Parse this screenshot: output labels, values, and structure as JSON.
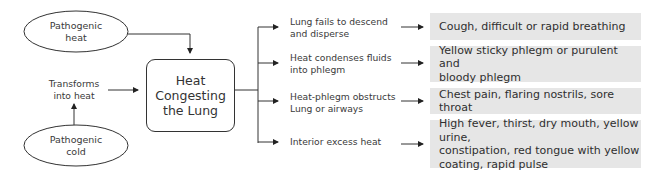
{
  "causes": {
    "heat": "Pathogenic heat",
    "heat_lines": [
      "Pathogenic",
      "heat"
    ],
    "cold_lines": [
      "Pathogenic",
      "cold"
    ],
    "transform_lines": [
      "Transforms",
      "into heat"
    ]
  },
  "center": {
    "lines": [
      "Heat",
      "Congesting",
      "the Lung"
    ]
  },
  "mechanisms": [
    {
      "lines": [
        "Lung fails to descend",
        "and disperse"
      ]
    },
    {
      "lines": [
        "Heat condenses fluids",
        "into phlegm"
      ]
    },
    {
      "lines": [
        "Heat-phlegm obstructs",
        "Lung or airways"
      ]
    },
    {
      "lines": [
        "Interior excess heat"
      ]
    }
  ],
  "symptoms": [
    {
      "lines": [
        "Cough, difficult or rapid breathing"
      ]
    },
    {
      "lines": [
        "Yellow sticky phlegm or purulent and",
        "bloody phlegm"
      ]
    },
    {
      "lines": [
        "Chest pain, flaring nostrils, sore throat"
      ]
    },
    {
      "lines": [
        "High fever, thirst, dry mouth, yellow urine,",
        "constipation, red tongue with yellow",
        "coating, rapid pulse"
      ]
    }
  ],
  "colors": {
    "line": "#333333",
    "symptom_box": "#e6e6e6"
  }
}
